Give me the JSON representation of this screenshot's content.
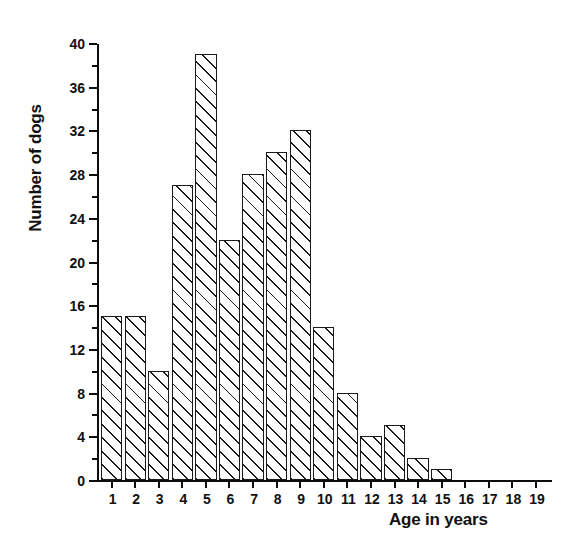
{
  "chart_data": {
    "type": "bar",
    "title": "",
    "xlabel": "Age in years",
    "ylabel": "Number of dogs",
    "categories": [
      "1",
      "2",
      "3",
      "4",
      "5",
      "6",
      "7",
      "8",
      "9",
      "10",
      "11",
      "12",
      "13",
      "14",
      "15",
      "16",
      "17",
      "18",
      "19"
    ],
    "values": [
      15,
      15,
      10,
      27,
      39,
      22,
      28,
      30,
      32,
      14,
      8,
      4,
      5,
      2,
      1,
      0,
      0,
      0,
      0
    ],
    "xlim": [
      0.5,
      19.5
    ],
    "ylim": [
      0,
      40
    ],
    "y_ticks_major": [
      0,
      4,
      8,
      12,
      16,
      20,
      24,
      28,
      32,
      36,
      40
    ],
    "y_ticks_minor": [
      2,
      6,
      10,
      14,
      18,
      22,
      26,
      30,
      34,
      38
    ],
    "y_tick_labels": [
      "0",
      "4",
      "8",
      "12",
      "16",
      "20",
      "24",
      "28",
      "32",
      "36",
      "40"
    ],
    "grid": false,
    "legend": null,
    "bar_style": {
      "fill": "#ffffff",
      "edge_color": "#1a1a1a",
      "hatch": "diagonal-45"
    },
    "axis_color": "#0d0d0d"
  }
}
